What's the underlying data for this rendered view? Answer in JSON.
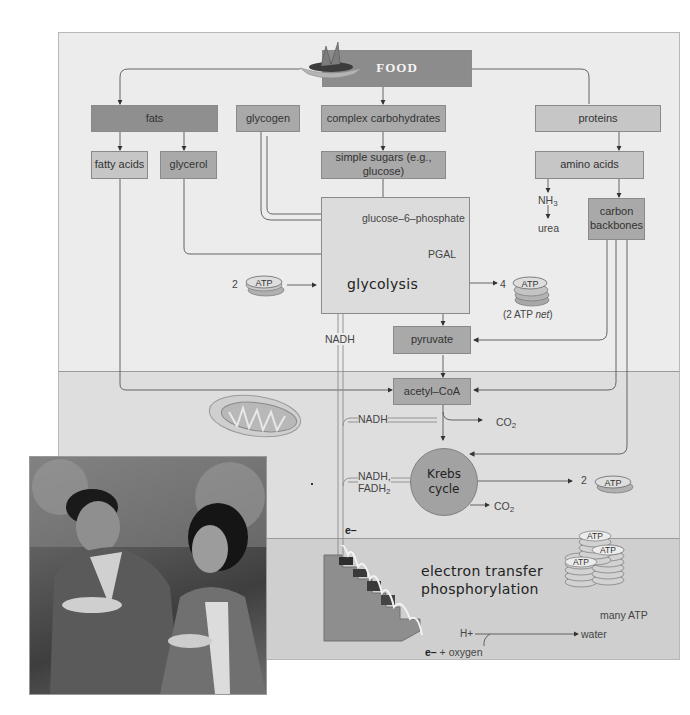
{
  "diagram": {
    "title": "FOOD",
    "top_sources": {
      "fats": "fats",
      "glycogen": "glycogen",
      "complex_carbs": "complex carbohydrates",
      "proteins": "proteins"
    },
    "breakdown": {
      "fatty_acids": "fatty acids",
      "glycerol": "glycerol",
      "simple_sugars": "simple sugars (e.g., glucose)",
      "amino_acids": "amino acids",
      "nh3": "NH",
      "nh3_sub": "3",
      "urea": "urea",
      "carbon_backbones_line1": "carbon",
      "carbon_backbones_line2": "backbones"
    },
    "glycolysis": {
      "glucose6p": "glucose–6–phosphate",
      "pgal": "PGAL",
      "label": "glycolysis",
      "atp_in_count": "2",
      "atp_out_count": "4",
      "atp_label": "ATP",
      "net_prefix": "(2 ATP ",
      "net_italic": "net",
      "net_suffix": ")",
      "nadh": "NADH",
      "pyruvate": "pyruvate"
    },
    "krebs": {
      "acetyl_coa": "acetyl–CoA",
      "nadh": "NADH",
      "co2_a": "CO",
      "co2_b": "CO",
      "co2_sub": "2",
      "nadh_fadh_1": "NADH,",
      "fadh": "FADH",
      "fadh_sub": "2",
      "cycle_line1": "Krebs",
      "cycle_line2": "cycle",
      "atp_count": "2",
      "atp_label": "ATP"
    },
    "etp": {
      "electron": "e–",
      "title_line1": "electron transfer",
      "title_line2": "phosphorylation",
      "atp_label": "ATP",
      "many_atp": "many ATP",
      "h_plus": "H+",
      "water": "water",
      "e_minus": "e–",
      "plus": "+",
      "oxygen": "oxygen"
    }
  },
  "colors": {
    "panel_top": "#ececec",
    "panel_mid": "#dedede",
    "panel_bot": "#cfcfcf",
    "box_dark": "#8f8f8f",
    "box_mid": "#a9a9a9",
    "box_light": "#c6c6c6"
  }
}
